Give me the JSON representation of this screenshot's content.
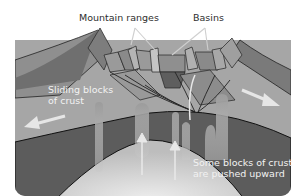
{
  "diagram": {
    "labels": {
      "mountain_ranges": "Mountain ranges",
      "basins": "Basins",
      "sliding_blocks": "Sliding blocks of crust",
      "pushed_upward": "Some blocks of crust are pushed upward"
    },
    "colors": {
      "surface_light": "#a9a9a9",
      "surface_mid": "#8c8c8c",
      "block_dark": "#6e6e6e",
      "mantle_dark": "#5a5a5a",
      "magma_light": "#d9d9d9",
      "plume": "#9a9a9a",
      "arrow": "#e6e6e6",
      "outline": "#222222"
    }
  }
}
